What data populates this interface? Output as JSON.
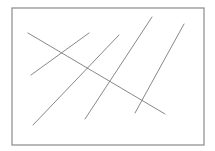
{
  "diagram": {
    "background": "#ffffff",
    "frame": {
      "x": 12,
      "y": 8,
      "width": 192,
      "height": 137,
      "stroke": "#8a8a8a",
      "stroke_width": 1.2
    },
    "line_color": "#7a7a7a",
    "line_width": 0.9,
    "lines": [
      {
        "id": "transversal",
        "x1": 28,
        "y1": 33,
        "x2": 165,
        "y2": 114
      },
      {
        "id": "parallel-1",
        "x1": 31,
        "y1": 75,
        "x2": 89,
        "y2": 33
      },
      {
        "id": "parallel-2",
        "x1": 33,
        "y1": 125,
        "x2": 119,
        "y2": 35
      },
      {
        "id": "parallel-3",
        "x1": 85,
        "y1": 119,
        "x2": 152,
        "y2": 17
      },
      {
        "id": "parallel-4",
        "x1": 135,
        "y1": 113,
        "x2": 184,
        "y2": 24
      }
    ]
  }
}
